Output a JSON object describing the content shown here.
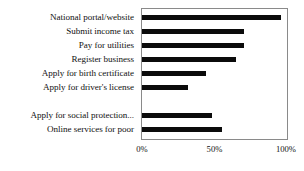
{
  "chart_data": {
    "type": "bar",
    "orientation": "horizontal",
    "title": "",
    "subtitle": "",
    "xlabel": "",
    "ylabel": "",
    "xlim": [
      0,
      100
    ],
    "xticks": [
      0,
      50,
      100
    ],
    "xtick_labels": [
      "0%",
      "50%",
      "100%"
    ],
    "grid": false,
    "legend": false,
    "bar_color": "#0b0b0b",
    "frame_color": "#8a8a8a",
    "background": "#ffffff",
    "categories": [
      "National portal/website",
      "Submit income tax",
      "Pay for utilities",
      "Register business",
      "Apply for birth certificate",
      "Apply for driver's license",
      "",
      "Apply for social protection...",
      "Online services for poor"
    ],
    "values": [
      96,
      70,
      70,
      65,
      44,
      32,
      null,
      48,
      55
    ],
    "series": [
      {
        "name": "",
        "values": [
          96,
          70,
          70,
          65,
          44,
          32,
          null,
          48,
          55
        ]
      }
    ]
  }
}
